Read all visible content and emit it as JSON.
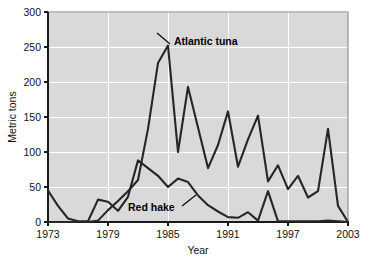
{
  "chart_data": {
    "type": "line",
    "title": "",
    "xlabel": "Year",
    "ylabel": "Metric tons",
    "xlim": [
      1973,
      2003
    ],
    "ylim": [
      0,
      300
    ],
    "xticks": [
      1973,
      1979,
      1985,
      1991,
      1997,
      2003
    ],
    "yticks": [
      0,
      50,
      100,
      150,
      200,
      250,
      300
    ],
    "grid": true,
    "legend_position": "inline-annotations",
    "x": [
      1973,
      1974,
      1975,
      1976,
      1977,
      1978,
      1979,
      1980,
      1981,
      1982,
      1983,
      1984,
      1985,
      1986,
      1987,
      1988,
      1989,
      1990,
      1991,
      1992,
      1993,
      1994,
      1995,
      1996,
      1997,
      1998,
      1999,
      2000,
      2001,
      2002,
      2003
    ],
    "series": [
      {
        "name": "Atlantic tuna",
        "color": "#262626",
        "values": [
          0,
          0,
          0,
          0,
          0,
          2,
          17,
          30,
          44,
          60,
          133,
          227,
          252,
          100,
          193,
          135,
          77,
          110,
          158,
          79,
          118,
          152,
          58,
          81,
          47,
          66,
          35,
          44,
          133,
          23,
          0
        ]
      },
      {
        "name": "Red hake",
        "color": "#262626",
        "values": [
          45,
          23,
          5,
          1,
          1,
          32,
          29,
          16,
          36,
          88,
          77,
          66,
          50,
          62,
          57,
          38,
          24,
          15,
          7,
          6,
          14,
          2,
          44,
          1,
          1,
          1,
          1,
          1,
          2,
          1,
          0
        ]
      }
    ],
    "annotations": [
      {
        "label": "Atlantic tuna",
        "text_x": 174,
        "text_y": 45,
        "leader_from_x": 170,
        "leader_from_y": 44,
        "leader_to_x": 157,
        "leader_to_y": 33
      },
      {
        "label": "Red hake",
        "text_x": 128,
        "text_y": 211,
        "leader_from_x": 182,
        "leader_from_y": 206,
        "leader_to_x": 196,
        "leader_to_y": 195
      }
    ],
    "colors": {
      "plot_background": "#d9d9d9",
      "gridline": "#ffffff",
      "axis": "#1a1a1a",
      "line": "#262626",
      "page_background": "#ffffff"
    }
  },
  "axis": {
    "y_title": "Metric tons",
    "x_title": "Year",
    "y_tick_labels": [
      "300",
      "250",
      "200",
      "150",
      "100",
      "50",
      "0"
    ],
    "x_tick_labels": [
      "1973",
      "1979",
      "1985",
      "1991",
      "1997",
      "2003"
    ]
  },
  "annotations": {
    "tuna_label": "Atlantic tuna",
    "hake_label": "Red hake"
  }
}
